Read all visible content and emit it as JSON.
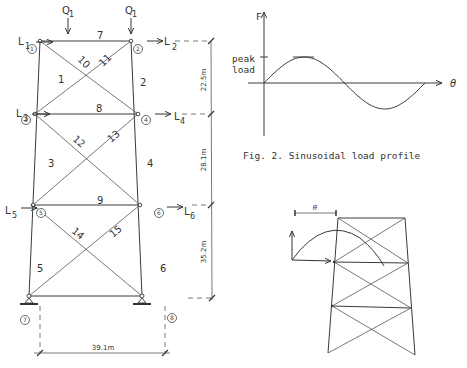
{
  "tower": {
    "loads": {
      "Q_left": {
        "main": "Q",
        "sub": "1"
      },
      "Q_right": {
        "main": "Q",
        "sub": "1"
      },
      "L1": {
        "main": "L",
        "sub": "1"
      },
      "L2": {
        "main": "L",
        "sub": "2"
      },
      "L3": {
        "main": "L",
        "sub": "3"
      },
      "L4": {
        "main": "L",
        "sub": "4"
      },
      "L5": {
        "main": "L",
        "sub": "5"
      },
      "L6": {
        "main": "L",
        "sub": "6"
      }
    },
    "nodes": [
      "1",
      "2",
      "3",
      "4",
      "5",
      "6",
      "7",
      "8"
    ],
    "members": [
      "1",
      "2",
      "3",
      "4",
      "5",
      "6",
      "7",
      "8",
      "9",
      "10",
      "11",
      "12",
      "13",
      "14",
      "15"
    ],
    "dimensions": {
      "h1": "22.5m",
      "h2": "28.1m",
      "h3": "35.2m",
      "base": "39.1m"
    }
  },
  "chart_data": {
    "type": "line",
    "title": "Fig. 2.  Sinusoidal load profile",
    "xlabel": "θ",
    "ylabel": "F",
    "y_annotation": "peak load",
    "y_annotation_lines": [
      "peak",
      "load"
    ],
    "series": [
      {
        "name": "load",
        "function": "sin",
        "x": [
          0,
          45,
          90,
          135,
          180,
          225,
          270,
          315,
          360
        ],
        "values": [
          0,
          0.707,
          1,
          0.707,
          0,
          -0.707,
          -1,
          -0.707,
          0
        ]
      }
    ],
    "xlim": [
      0,
      360
    ],
    "ylim": [
      -1.6,
      2.1
    ],
    "grid": false
  },
  "inset": {
    "angle_label": "θ"
  }
}
